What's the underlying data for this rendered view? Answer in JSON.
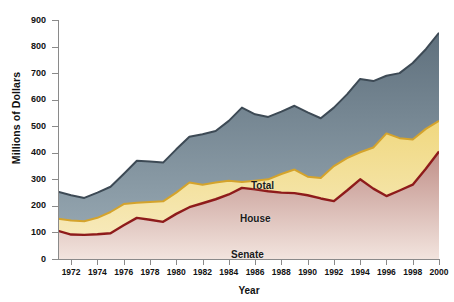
{
  "chart_data": {
    "type": "area",
    "title": "",
    "xlabel": "Year",
    "ylabel": "Millions of Dollars",
    "xlim": [
      1971,
      2000
    ],
    "ylim": [
      0,
      900
    ],
    "grid": false,
    "legend_position": "inline-annotations",
    "stacked": false,
    "x": [
      1971,
      1972,
      1973,
      1974,
      1975,
      1976,
      1977,
      1978,
      1979,
      1980,
      1981,
      1982,
      1983,
      1984,
      1985,
      1986,
      1987,
      1988,
      1989,
      1990,
      1991,
      1992,
      1993,
      1994,
      1995,
      1996,
      1997,
      1998,
      1999,
      2000
    ],
    "x_tick_labels": [
      "1972",
      "1974",
      "1976",
      "1978",
      "1980",
      "1982",
      "1984",
      "1986",
      "1988",
      "1990",
      "1992",
      "1994",
      "1996",
      "1998",
      "2000"
    ],
    "x_tick_values": [
      1972,
      1974,
      1976,
      1978,
      1980,
      1982,
      1984,
      1986,
      1988,
      1990,
      1992,
      1994,
      1996,
      1998,
      2000
    ],
    "y_tick_labels": [
      "0",
      "100",
      "200",
      "300",
      "400",
      "500",
      "600",
      "700",
      "800",
      "900"
    ],
    "y_tick_values": [
      0,
      100,
      200,
      300,
      400,
      500,
      600,
      700,
      800,
      900
    ],
    "series": [
      {
        "name": "Total",
        "color": "#78899a",
        "line_color": "#3d4a55",
        "values": [
          253,
          240,
          230,
          250,
          272,
          320,
          370,
          367,
          363,
          413,
          460,
          470,
          482,
          520,
          570,
          545,
          535,
          555,
          577,
          552,
          530,
          570,
          620,
          678,
          670,
          690,
          700,
          738,
          790,
          852
        ]
      },
      {
        "name": "House",
        "color": "#f3e4a8",
        "line_color": "#d4a32c",
        "values": [
          152,
          145,
          142,
          155,
          177,
          207,
          212,
          215,
          217,
          250,
          288,
          280,
          288,
          295,
          290,
          295,
          300,
          320,
          337,
          310,
          305,
          350,
          380,
          402,
          420,
          473,
          455,
          450,
          490,
          520
        ]
      },
      {
        "name": "Senate",
        "color": "#d9b3ac",
        "line_color": "#8e1b1b",
        "values": [
          106,
          92,
          91,
          93,
          97,
          127,
          155,
          148,
          140,
          170,
          195,
          210,
          225,
          243,
          268,
          262,
          255,
          250,
          248,
          240,
          228,
          218,
          258,
          300,
          265,
          237,
          258,
          280,
          340,
          405
        ]
      }
    ],
    "annotations": [
      {
        "text": "Total",
        "series": "Total"
      },
      {
        "text": "House",
        "series": "House"
      },
      {
        "text": "Senate",
        "series": "Senate"
      }
    ]
  }
}
